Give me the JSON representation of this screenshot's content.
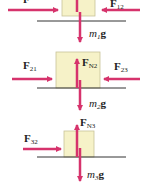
{
  "colors": {
    "arrow": "#d6336c",
    "block_fill": "#f6f2c8",
    "block_stroke": "#c9c39a",
    "surface": "#333333",
    "text": "#222222"
  },
  "diagrams": [
    {
      "id": "block-1",
      "forces": [
        {
          "symbol": "F",
          "subscript": "",
          "direction": "right",
          "label": "F"
        },
        {
          "symbol": "F",
          "subscript": "12",
          "direction": "left",
          "label": "F12"
        },
        {
          "symbol": "F",
          "subscript": "N1",
          "direction": "up",
          "label": "FN1 (cropped)"
        },
        {
          "symbol": "g",
          "prefix": "m",
          "prefix_sub": "1",
          "direction": "down",
          "label": "m1g"
        }
      ],
      "labels": {
        "left": "F",
        "right": "F",
        "right_sub": "12",
        "down_prefix": "m",
        "down_sub": "1",
        "down_vec": "g"
      }
    },
    {
      "id": "block-2",
      "forces": [
        {
          "symbol": "F",
          "subscript": "21",
          "direction": "right",
          "label": "F21"
        },
        {
          "symbol": "F",
          "subscript": "N2",
          "direction": "up",
          "label": "FN2"
        },
        {
          "symbol": "F",
          "subscript": "23",
          "direction": "left",
          "label": "F23"
        },
        {
          "symbol": "g",
          "prefix": "m",
          "prefix_sub": "2",
          "direction": "down",
          "label": "m2g"
        }
      ],
      "labels": {
        "left": "F",
        "left_sub": "21",
        "up": "F",
        "up_sub": "N2",
        "right": "F",
        "right_sub": "23",
        "down_prefix": "m",
        "down_sub": "2",
        "down_vec": "g"
      }
    },
    {
      "id": "block-3",
      "forces": [
        {
          "symbol": "F",
          "subscript": "32",
          "direction": "right",
          "label": "F32"
        },
        {
          "symbol": "F",
          "subscript": "N3",
          "direction": "up",
          "label": "FN3"
        },
        {
          "symbol": "g",
          "prefix": "m",
          "prefix_sub": "3",
          "direction": "down",
          "label": "m3g"
        }
      ],
      "labels": {
        "left": "F",
        "left_sub": "32",
        "up": "F",
        "up_sub": "N3",
        "down_prefix": "m",
        "down_sub": "3",
        "down_vec": "g"
      }
    }
  ]
}
